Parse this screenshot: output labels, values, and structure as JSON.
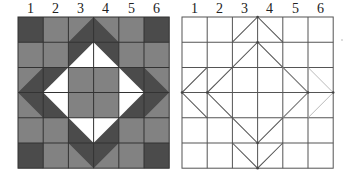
{
  "figure": {
    "column_labels": [
      "1",
      "2",
      "3",
      "4",
      "5",
      "6"
    ],
    "grid": {
      "rows": 6,
      "cols": 6,
      "cell_px": 25.2
    },
    "colors": {
      "dark": "#4b4b4b",
      "medium": "#828282",
      "white": "#ffffff",
      "grid_line": "#333333",
      "outline": "#555555",
      "faint_outline": "#b0b0b0"
    },
    "left_panel": {
      "name": "shaded-pattern",
      "x": 18,
      "y": 17
    },
    "right_panel": {
      "name": "outline-pattern",
      "x": 182,
      "y": 17
    }
  }
}
